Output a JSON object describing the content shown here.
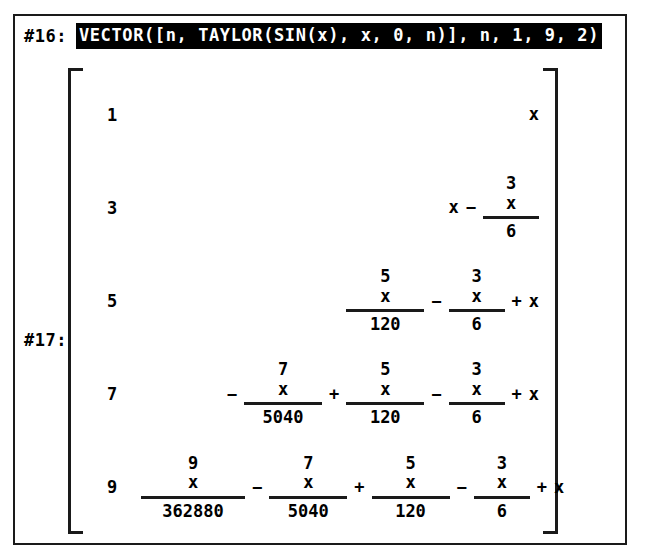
{
  "window": {
    "border_color": "#1a1a1a",
    "background": "#ffffff"
  },
  "input_line": {
    "label": "#16:",
    "expression": "VECTOR([n, TAYLOR(SIN(x), x, 0, n)], n, 1, 9, 2)",
    "highlighted": true,
    "highlight_bg": "#000000",
    "highlight_fg": "#ffffff"
  },
  "output_line": {
    "label": "#17:",
    "bracket_left": "[",
    "bracket_right": "]",
    "rows": [
      {
        "index": "1",
        "terms": [
          {
            "op": "",
            "kind": "var",
            "text": "x"
          }
        ]
      },
      {
        "index": "3",
        "terms": [
          {
            "op": "",
            "kind": "var",
            "text": "x"
          },
          {
            "op": "−",
            "kind": "frac",
            "num_base": "x",
            "num_exp": "3",
            "den": "6",
            "width": ""
          }
        ]
      },
      {
        "index": "5",
        "terms": [
          {
            "op": "",
            "kind": "frac",
            "num_base": "x",
            "num_exp": "5",
            "den": "120",
            "width": "wide"
          },
          {
            "op": "−",
            "kind": "frac",
            "num_base": "x",
            "num_exp": "3",
            "den": "6",
            "width": ""
          },
          {
            "op": "+",
            "kind": "var",
            "text": "x"
          }
        ]
      },
      {
        "index": "7",
        "terms": [
          {
            "op": "−",
            "kind": "frac",
            "num_base": "x",
            "num_exp": "7",
            "den": "5040",
            "width": "wide"
          },
          {
            "op": "+",
            "kind": "frac",
            "num_base": "x",
            "num_exp": "5",
            "den": "120",
            "width": "wide"
          },
          {
            "op": "−",
            "kind": "frac",
            "num_base": "x",
            "num_exp": "3",
            "den": "6",
            "width": ""
          },
          {
            "op": "+",
            "kind": "var",
            "text": "x"
          }
        ]
      },
      {
        "index": "9",
        "terms": [
          {
            "op": "",
            "kind": "frac",
            "num_base": "x",
            "num_exp": "9",
            "den": "362880",
            "width": "xwide"
          },
          {
            "op": "−",
            "kind": "frac",
            "num_base": "x",
            "num_exp": "7",
            "den": "5040",
            "width": "wide"
          },
          {
            "op": "+",
            "kind": "frac",
            "num_base": "x",
            "num_exp": "5",
            "den": "120",
            "width": "wide"
          },
          {
            "op": "−",
            "kind": "frac",
            "num_base": "x",
            "num_exp": "3",
            "den": "6",
            "width": ""
          },
          {
            "op": "+",
            "kind": "var",
            "text": "x"
          }
        ]
      }
    ]
  }
}
